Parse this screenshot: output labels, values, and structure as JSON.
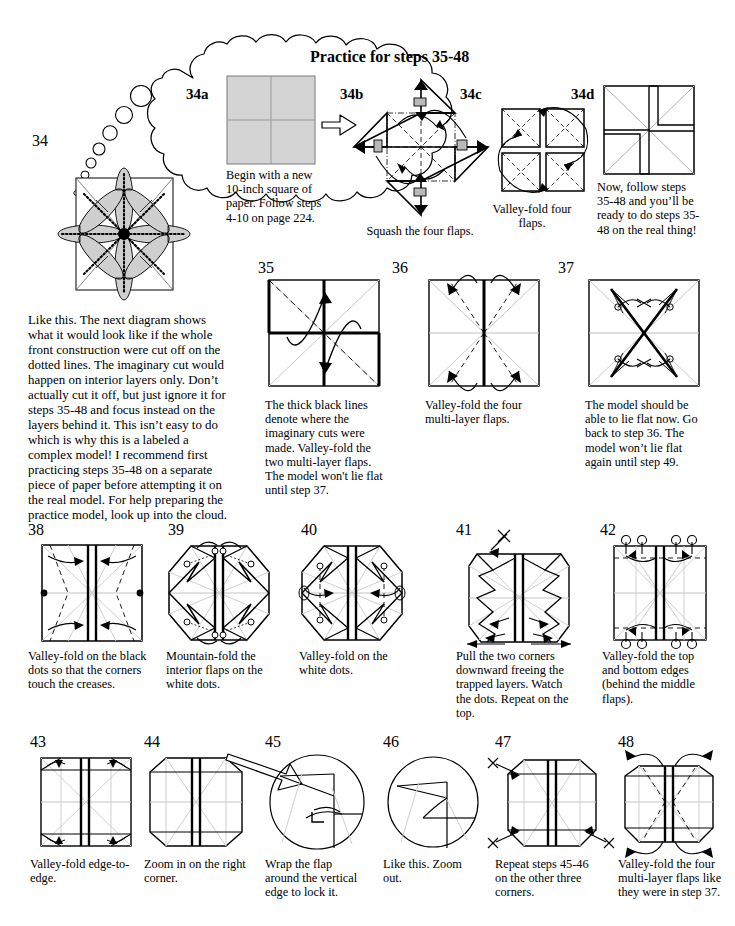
{
  "page": {
    "width": 735,
    "height": 926,
    "background": "#ffffff",
    "ink": "#000000",
    "paper_fill": "#d4d4d4",
    "crease_gray": "#bdbdbd"
  },
  "cloud": {
    "title": "Practice for steps 35-48",
    "substeps": [
      {
        "label": "34a",
        "caption": "Begin with a new 10-inch square of paper.  Follow steps 4-10 on page 224."
      },
      {
        "label": "34b",
        "caption": "Squash the four flaps."
      },
      {
        "label": "34c",
        "caption": "Valley-fold four flaps."
      },
      {
        "label": "34d",
        "caption": "Now, follow steps 35-48 and you’ll be ready to do steps 35-48 on the real thing!"
      }
    ]
  },
  "step34": {
    "label": "34",
    "body_text": "Like this.  The next diagram shows what it would look like if the whole front construction were cut off on the dotted lines.  The imaginary cut would happen on interior layers only. Don’t actually cut it off, but just ignore it for steps 35-48 and focus instead on the layers behind it.  This isn’t easy to do which is why this is a labeled a complex model! I recommend first practicing steps 35-48 on a separate piece of paper before attempting it on the real model. For help preparing the practice model, look up into the cloud."
  },
  "row1": [
    {
      "label": "35",
      "caption": "The thick black lines denote where the imaginary cuts were made. Valley-fold the two multi-layer flaps. The model won't lie flat until step 37."
    },
    {
      "label": "36",
      "caption": "Valley-fold the four multi-layer flaps."
    },
    {
      "label": "37",
      "caption": "The model should be able to lie flat now. Go back to step 36. The model won’t lie flat again until step 49."
    }
  ],
  "row2": [
    {
      "label": "38",
      "caption": "Valley-fold on the black dots so that the corners touch the creases."
    },
    {
      "label": "39",
      "caption": "Mountain-fold the interior flaps on the white dots."
    },
    {
      "label": "40",
      "caption": "Valley-fold on the white  dots."
    },
    {
      "label": "41",
      "caption": "Pull the two corners downward freeing the trapped layers. Watch the dots.  Repeat on the top."
    },
    {
      "label": "42",
      "caption": "Valley-fold the top and bottom edges (behind the middle flaps)."
    }
  ],
  "row3": [
    {
      "label": "43",
      "caption": "Valley-fold edge-to-edge."
    },
    {
      "label": "44",
      "caption": "Zoom in on the right corner."
    },
    {
      "label": "45",
      "caption": "Wrap the flap around the vertical edge to lock it."
    },
    {
      "label": "46",
      "caption": "Like this. Zoom out."
    },
    {
      "label": "47",
      "caption": "Repeat steps 45-46 on the other three corners."
    },
    {
      "label": "48",
      "caption": "Valley-fold the four multi-layer flaps like they were in step 37."
    }
  ]
}
